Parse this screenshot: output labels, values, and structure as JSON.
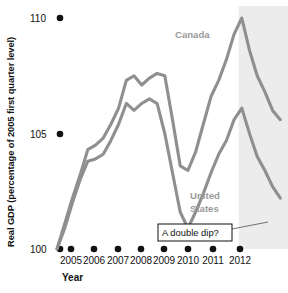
{
  "chart_data": {
    "type": "line",
    "title": "",
    "xlabel": "Year",
    "ylabel": "Real GDP (percentage of 2005 first quarter level)",
    "ylim": [
      100,
      110
    ],
    "yticks": [
      100,
      105,
      110
    ],
    "ytick_labels": [
      "100",
      "105",
      "110"
    ],
    "xlim": [
      2005,
      2012.5
    ],
    "categories": [
      "2005",
      "2006",
      "2007",
      "2008",
      "2009",
      "2010",
      "2011",
      "2012"
    ],
    "xtick_labels": [
      "2005",
      "2006",
      "2007",
      "2008",
      "2009",
      "2010",
      "2011",
      "2012"
    ],
    "grid": false,
    "legend_position": "inline-annotations",
    "series": [
      {
        "name": "Canada",
        "color": "#8f8f8f",
        "x": [
          2005.0,
          2005.25,
          2005.5,
          2005.75,
          2006.0,
          2006.25,
          2006.5,
          2006.75,
          2007.0,
          2007.25,
          2007.5,
          2007.75,
          2008.0,
          2008.25,
          2008.5,
          2008.75,
          2009.0,
          2009.25,
          2009.5,
          2009.75,
          2010.0,
          2010.25,
          2010.5,
          2010.75,
          2011.0,
          2011.25,
          2011.5,
          2011.75,
          2012.0,
          2012.25
        ],
        "values": [
          100.0,
          101.1,
          102.2,
          103.2,
          104.3,
          104.5,
          104.8,
          105.4,
          106.1,
          107.3,
          107.5,
          107.1,
          107.4,
          107.6,
          107.5,
          105.6,
          103.6,
          103.4,
          104.2,
          105.4,
          106.6,
          107.3,
          108.2,
          109.3,
          110.0,
          108.6,
          107.5,
          106.8,
          106.0,
          105.6
        ]
      },
      {
        "name": "United States",
        "color": "#8f8f8f",
        "x": [
          2005.0,
          2005.25,
          2005.5,
          2005.75,
          2006.0,
          2006.25,
          2006.5,
          2006.75,
          2007.0,
          2007.25,
          2007.5,
          2007.75,
          2008.0,
          2008.25,
          2008.5,
          2008.75,
          2009.0,
          2009.25,
          2009.5,
          2009.75,
          2010.0,
          2010.25,
          2010.5,
          2010.75,
          2011.0,
          2011.25,
          2011.5,
          2011.75,
          2012.0,
          2012.25
        ],
        "values": [
          100.0,
          100.9,
          102.0,
          103.0,
          103.8,
          103.9,
          104.1,
          104.7,
          105.4,
          106.3,
          106.0,
          106.3,
          106.5,
          106.3,
          105.0,
          103.3,
          101.6,
          100.9,
          101.6,
          102.4,
          103.3,
          104.1,
          104.7,
          105.6,
          106.1,
          105.0,
          104.0,
          103.4,
          102.7,
          102.2
        ]
      }
    ],
    "annotations": [
      {
        "name": "canada-label",
        "text": "Canada",
        "x": 2010.0,
        "y": 108.5
      },
      {
        "name": "united-states-label",
        "text": "United States",
        "x": 2010.0,
        "y": 102.3
      },
      {
        "name": "double-dip-callout",
        "text": "A double dip?",
        "x": 2009.4,
        "y": 100.3
      }
    ],
    "shaded_regions": [
      {
        "name": "forecast-band",
        "from": 2010.9,
        "to": 2012.5,
        "color": "#ececec"
      }
    ]
  },
  "colors": {
    "line": "#8f8f8f",
    "label_gray": "#9a9a9a",
    "shade": "#ececec",
    "text": "#111111",
    "background": "#ffffff"
  }
}
